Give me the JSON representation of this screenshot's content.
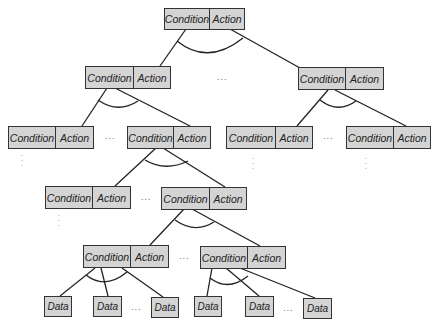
{
  "diagram": {
    "type": "and-tree",
    "node_labels": {
      "condition": "Condition",
      "action": "Action",
      "data": "Data"
    },
    "ellipsis_h": "...",
    "ellipsis_v": "⋮",
    "colors": {
      "box_fill": "#d4d4d4",
      "box_border": "#333333",
      "edge": "#222222",
      "text": "#222222"
    },
    "nodes": [
      {
        "id": "root",
        "condition": "Condition",
        "action": "Action"
      },
      {
        "id": "l2-left",
        "condition": "Condition",
        "action": "Action"
      },
      {
        "id": "l2-right",
        "condition": "Condition",
        "action": "Action"
      },
      {
        "id": "l3-1",
        "condition": "Condition",
        "action": "Action"
      },
      {
        "id": "l3-2",
        "condition": "Condition",
        "action": "Action"
      },
      {
        "id": "l3-3",
        "condition": "Condition",
        "action": "Action"
      },
      {
        "id": "l3-4",
        "condition": "Condition",
        "action": "Action"
      },
      {
        "id": "l4-1",
        "condition": "Condition",
        "action": "Action"
      },
      {
        "id": "l4-2",
        "condition": "Condition",
        "action": "Action"
      },
      {
        "id": "l5-1",
        "condition": "Condition",
        "action": "Action"
      },
      {
        "id": "l5-2",
        "condition": "Condition",
        "action": "Action"
      }
    ],
    "data_nodes": [
      {
        "id": "d1",
        "label": "Data"
      },
      {
        "id": "d2",
        "label": "Data"
      },
      {
        "id": "d3",
        "label": "Data"
      },
      {
        "id": "d4",
        "label": "Data"
      },
      {
        "id": "d5",
        "label": "Data"
      },
      {
        "id": "d6",
        "label": "Data"
      }
    ]
  }
}
